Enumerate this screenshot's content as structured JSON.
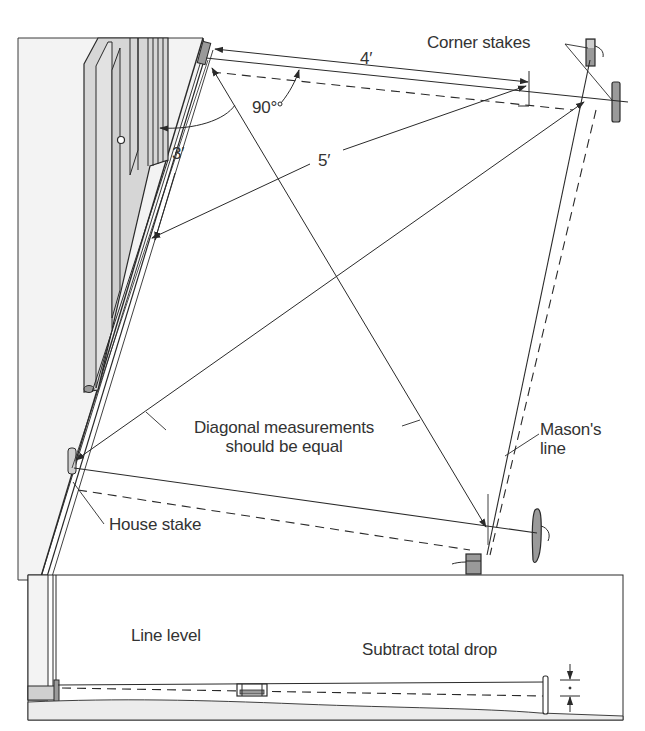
{
  "figure": {
    "type": "technical-illustration",
    "colors": {
      "ink": "#2a2a2a",
      "wall_fill": "#f2f2f2",
      "door_fill": "#d9d9d9",
      "stake_fill": "#9a9a9a",
      "ground_fill": "#ececec",
      "background": "#ffffff"
    }
  },
  "labels": {
    "corner_stakes": "Corner stakes",
    "dim_4ft": "4′",
    "dim_3ft": "3′",
    "dim_5ft": "5′",
    "angle_90": "90°",
    "diagonal_line1": "Diagonal measurements",
    "diagonal_line2": "should be equal",
    "masons_line1": "Mason's",
    "masons_line2": "line",
    "house_stake": "House stake",
    "line_level": "Line level",
    "subtract_total_drop": "Subtract total drop"
  },
  "measurements": {
    "triangle": {
      "side_a": "3′",
      "side_b": "4′",
      "hypotenuse": "5′",
      "angle": "90°"
    }
  }
}
